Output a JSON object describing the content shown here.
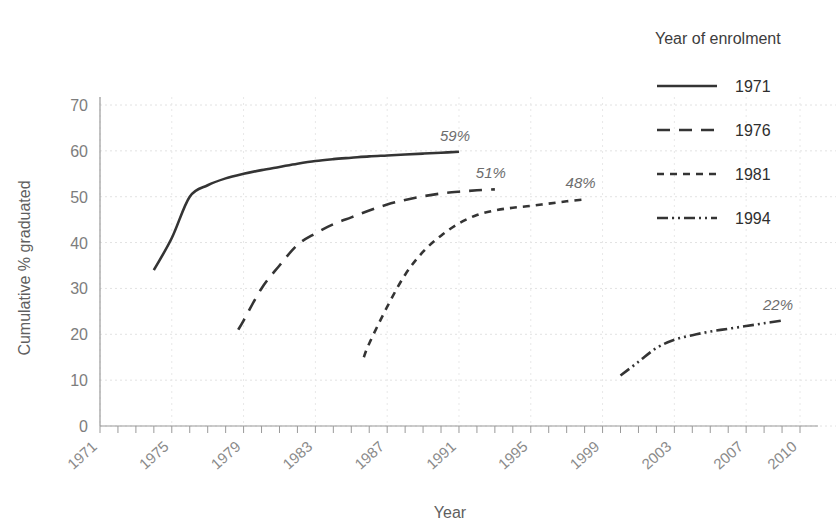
{
  "chart_data": {
    "type": "line",
    "title": "",
    "xlabel": "Year",
    "ylabel": "Cumulative % graduated",
    "xlim": [
      1971,
      2010
    ],
    "ylim": [
      0,
      70
    ],
    "grid": true,
    "legend_position": "right",
    "legend_title": "Year of enrolment",
    "y_ticks": [
      0,
      10,
      20,
      30,
      40,
      50,
      60,
      70
    ],
    "y_tick_labels": [
      "0",
      "10",
      "20",
      "30",
      "40",
      "50",
      "60",
      "70"
    ],
    "x_tick_labels": [
      "1971",
      "1975",
      "1979",
      "1983",
      "1987",
      "1991",
      "1995",
      "1999",
      "2003",
      "2007",
      "2010"
    ],
    "x_tick_label_years": [
      1971,
      1975,
      1979,
      1983,
      1987,
      1991,
      1995,
      1999,
      2003,
      2007,
      2010
    ],
    "x_minor_tick_step": 1,
    "line_color": "#343434",
    "grid_color": "#e2e2e2",
    "axis_color": "#9a9a9a",
    "series": [
      {
        "name": "1971",
        "dash_style": "solid",
        "dasharray": "none",
        "end_label": "59%",
        "end_label_value": 59,
        "x": [
          1974,
          1975,
          1976,
          1977,
          1978,
          1979,
          1980,
          1981,
          1982,
          1983,
          1984,
          1985,
          1986,
          1987,
          1988,
          1989,
          1990,
          1991
        ],
        "values": [
          34,
          41,
          50,
          52.5,
          54,
          55,
          55.8,
          56.5,
          57.2,
          57.8,
          58.2,
          58.5,
          58.8,
          59,
          59.2,
          59.4,
          59.6,
          59.8
        ]
      },
      {
        "name": "1976",
        "dash_style": "long-dash",
        "dasharray": "13 9",
        "end_label": "51%",
        "end_label_value": 51,
        "x": [
          1978.7,
          1979,
          1980,
          1981,
          1982,
          1983,
          1984,
          1985,
          1986,
          1987,
          1988,
          1989,
          1990,
          1991,
          1992,
          1993
        ],
        "values": [
          21,
          23,
          30,
          35,
          39.5,
          42,
          44,
          45.5,
          47,
          48.3,
          49.3,
          50.1,
          50.7,
          51.1,
          51.4,
          51.6
        ]
      },
      {
        "name": "1981",
        "dash_style": "short-dash",
        "dasharray": "7 6",
        "end_label": "48%",
        "end_label_value": 48,
        "x": [
          1985.7,
          1986,
          1987,
          1988,
          1989,
          1990,
          1991,
          1992,
          1993,
          1994,
          1995,
          1996,
          1997,
          1998
        ],
        "values": [
          15,
          18,
          26,
          33,
          38,
          41.5,
          44.2,
          46,
          47,
          47.6,
          48,
          48.5,
          49,
          49.4
        ]
      },
      {
        "name": "1994",
        "dash_style": "dash-dot-dot",
        "dasharray": "11 4 2 4 2 4",
        "end_label": "22%",
        "end_label_value": 22,
        "x": [
          2000,
          2001,
          2002,
          2003,
          2004,
          2005,
          2006,
          2007,
          2008,
          2009
        ],
        "values": [
          11,
          14,
          17,
          18.8,
          19.8,
          20.6,
          21.2,
          21.8,
          22.4,
          23
        ]
      }
    ]
  },
  "legend": {
    "title": "Year of enrolment",
    "items": [
      {
        "label": "1971",
        "dasharray": "none"
      },
      {
        "label": "1976",
        "dasharray": "13 9"
      },
      {
        "label": "1981",
        "dasharray": "7 6"
      },
      {
        "label": "1994",
        "dasharray": "11 4 2 4 2 4"
      }
    ]
  }
}
